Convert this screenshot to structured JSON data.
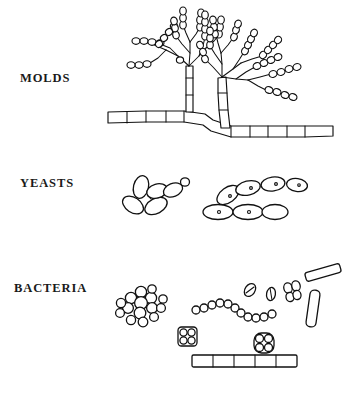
{
  "figure": {
    "background_color": "#ffffff",
    "ink_color": "#111111",
    "width": 357,
    "height": 393
  },
  "rows": [
    {
      "key": "molds",
      "label": "MOLDS",
      "label_x": 20,
      "label_y": 71,
      "structures": [
        "branched-conidiophore-left",
        "branched-conidiophore-right",
        "conidia-chains",
        "septate-hypha"
      ]
    },
    {
      "key": "yeasts",
      "label": "YEASTS",
      "label_x": 20,
      "label_y": 176,
      "structures": [
        "budding-yeast-cluster",
        "pseudohypha-chain"
      ]
    },
    {
      "key": "bacteria",
      "label": "BACTERIA",
      "label_x": 14,
      "label_y": 281,
      "structures": [
        "staphylococcus-cluster",
        "streptococcus-chain",
        "sarcina-packet-square",
        "sarcina-packet-round",
        "diplobacilli",
        "single-bacilli",
        "large-rod",
        "filamentous-bacterium"
      ]
    }
  ]
}
